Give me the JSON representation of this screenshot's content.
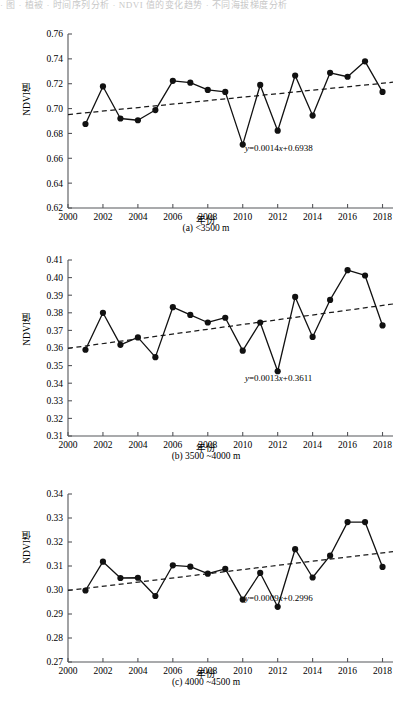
{
  "top_strip_text": "· 图 · 植被 · 时间序列分析 · NDVI 值的变化趋势 · 不同海拔梯度分析",
  "figure": {
    "axis_title_y": "NDVI值",
    "axis_title_x": "年份"
  },
  "panels": [
    {
      "id": "a",
      "caption": "(a) <3500 m",
      "equation": "y=0.0014x+0.6938",
      "equation_y_italic": "y",
      "equation_x_italic": "x"
    },
    {
      "id": "b",
      "caption": "(b) 3500 ~4000 m",
      "equation": "y=0.0013x+0.3611",
      "equation_y_italic": "y",
      "equation_x_italic": "x"
    },
    {
      "id": "c",
      "caption": "(c) 4000 ~4500 m",
      "equation": "y=0.0009x+0.2996",
      "equation_y_italic": "y",
      "equation_x_italic": "x"
    }
  ],
  "chart_data": [
    {
      "type": "line",
      "panel": "a",
      "title": "(a) <3500 m",
      "xlabel": "年份",
      "ylabel": "NDVI值",
      "xlim": [
        2000,
        2018.6
      ],
      "ylim": [
        0.62,
        0.76
      ],
      "yticks": [
        0.62,
        0.64,
        0.66,
        0.68,
        0.7,
        0.72,
        0.74,
        0.76
      ],
      "ytick_labels": [
        "0.62",
        "0.64",
        "0.66",
        "0.68",
        "0.70",
        "0.72",
        "0.74",
        "0.76"
      ],
      "xticks": [
        2000,
        2002,
        2004,
        2006,
        2008,
        2010,
        2012,
        2014,
        2016,
        2018
      ],
      "xtick_labels": [
        "2000",
        "2002",
        "2004",
        "2006",
        "2008",
        "2010",
        "2012",
        "2014",
        "2016",
        "2018"
      ],
      "grid": false,
      "legend": "none",
      "x": [
        2001,
        2002,
        2003,
        2004,
        2005,
        2006,
        2007,
        2008,
        2009,
        2010,
        2011,
        2012,
        2013,
        2014,
        2015,
        2016,
        2017,
        2018
      ],
      "series": [
        {
          "name": "NDVI",
          "marker": "filled-circle",
          "values": [
            0.6876,
            0.7178,
            0.692,
            0.6906,
            0.6988,
            0.7223,
            0.7208,
            0.715,
            0.7134,
            0.671,
            0.719,
            0.6822,
            0.7266,
            0.6944,
            0.7288,
            0.7256,
            0.738,
            0.7134
          ]
        }
      ],
      "trend": {
        "label": "y=0.0014x+0.6938",
        "slope_per_year": 0.0014,
        "intercept": 0.6938,
        "style": "dashed",
        "x_start": 2000,
        "x_end": 2018.6,
        "y_start": 0.6952,
        "y_end": 0.7212
      },
      "annotation": {
        "text": "y=0.0014x+0.6938",
        "x": 2012.2,
        "y": 0.6735
      }
    },
    {
      "type": "line",
      "panel": "b",
      "title": "(b) 3500 ~4000 m",
      "xlabel": "年份",
      "ylabel": "NDVI值",
      "xlim": [
        2000,
        2018.6
      ],
      "ylim": [
        0.31,
        0.41
      ],
      "yticks": [
        0.31,
        0.32,
        0.33,
        0.34,
        0.35,
        0.36,
        0.37,
        0.38,
        0.39,
        0.4,
        0.41
      ],
      "ytick_labels": [
        "0.31",
        "0.32",
        "0.33",
        "0.34",
        "0.35",
        "0.36",
        "0.37",
        "0.38",
        "0.39",
        "0.40",
        "0.41"
      ],
      "xticks": [
        2000,
        2002,
        2004,
        2006,
        2008,
        2010,
        2012,
        2014,
        2016,
        2018
      ],
      "xtick_labels": [
        "2000",
        "2002",
        "2004",
        "2006",
        "2008",
        "2010",
        "2012",
        "2014",
        "2016",
        "2018"
      ],
      "grid": false,
      "legend": "none",
      "x": [
        2001,
        2002,
        2003,
        2004,
        2005,
        2006,
        2007,
        2008,
        2009,
        2010,
        2011,
        2012,
        2013,
        2014,
        2015,
        2016,
        2017,
        2018
      ],
      "series": [
        {
          "name": "NDVI",
          "marker": "filled-circle",
          "values": [
            0.359,
            0.38,
            0.3618,
            0.366,
            0.3548,
            0.3832,
            0.3788,
            0.3745,
            0.3772,
            0.3585,
            0.3745,
            0.3468,
            0.389,
            0.3663,
            0.3873,
            0.4042,
            0.4012,
            0.3728
          ]
        }
      ],
      "trend": {
        "label": "y=0.0013x+0.3611",
        "slope_per_year": 0.0013,
        "intercept": 0.3611,
        "style": "dashed",
        "x_start": 2000,
        "x_end": 2018.6,
        "y_start": 0.3598,
        "y_end": 0.385
      },
      "annotation": {
        "text": "y=0.0013x+0.3611",
        "x": 2012.2,
        "y": 0.3503
      }
    },
    {
      "type": "line",
      "panel": "c",
      "title": "(c) 4000 ~4500 m",
      "xlabel": "年份",
      "ylabel": "NDVI值",
      "xlim": [
        2000,
        2018.6
      ],
      "ylim": [
        0.27,
        0.34
      ],
      "yticks": [
        0.27,
        0.28,
        0.29,
        0.3,
        0.31,
        0.32,
        0.33,
        0.34
      ],
      "ytick_labels": [
        "0.27",
        "0.28",
        "0.29",
        "0.30",
        "0.31",
        "0.32",
        "0.33",
        "0.34"
      ],
      "xticks": [
        2000,
        2002,
        2004,
        2006,
        2008,
        2010,
        2012,
        2014,
        2016,
        2018
      ],
      "xtick_labels": [
        "2000",
        "2002",
        "2004",
        "2006",
        "2008",
        "2010",
        "2012",
        "2014",
        "2016",
        "2018"
      ],
      "grid": false,
      "legend": "none",
      "x": [
        2001,
        2002,
        2003,
        2004,
        2005,
        2006,
        2007,
        2008,
        2009,
        2010,
        2011,
        2012,
        2013,
        2014,
        2015,
        2016,
        2017,
        2018
      ],
      "series": [
        {
          "name": "NDVI",
          "marker": "filled-circle",
          "values": [
            0.2998,
            0.3118,
            0.305,
            0.3051,
            0.2975,
            0.3103,
            0.3097,
            0.3068,
            0.3088,
            0.296,
            0.3071,
            0.293,
            0.317,
            0.3052,
            0.3143,
            0.3283,
            0.3283,
            0.3096
          ]
        }
      ],
      "trend": {
        "label": "y=0.0009x+0.2996",
        "slope_per_year": 0.0009,
        "intercept": 0.2996,
        "style": "dashed",
        "x_start": 2000,
        "x_end": 2018.6,
        "y_start": 0.2998,
        "y_end": 0.316
      },
      "annotation": {
        "text": "y=0.0009x+0.2996",
        "x": 2012.2,
        "y": 0.2912
      }
    }
  ]
}
